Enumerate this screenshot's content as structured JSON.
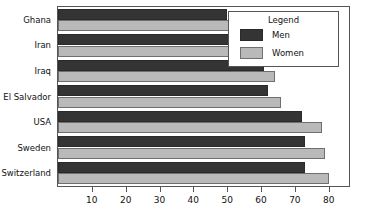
{
  "chart_data": {
    "type": "bar",
    "orientation": "horizontal",
    "title": "",
    "xlabel": "",
    "ylabel": "",
    "categories": [
      "Ghana",
      "Iran",
      "Iraq",
      "El Salvador",
      "USA",
      "Sweden",
      "Switzerland"
    ],
    "series": [
      {
        "name": "Men",
        "color": "#343434",
        "values": [
          50,
          57,
          61,
          62,
          72,
          73,
          73
        ]
      },
      {
        "name": "Women",
        "color": "#b9b9b9",
        "values": [
          54,
          57,
          64,
          66,
          78,
          79,
          80
        ]
      }
    ],
    "xlim": [
      0,
      86
    ],
    "xticks": [
      10,
      20,
      30,
      40,
      50,
      60,
      70,
      80
    ],
    "xticklabels": [
      "10",
      "20",
      "30",
      "40",
      "50",
      "60",
      "70",
      "80"
    ],
    "grid": false,
    "legend": {
      "title": "Legend",
      "position": "top-right",
      "entries": [
        {
          "label": "Men",
          "swatch": "men"
        },
        {
          "label": "Women",
          "swatch": "women"
        }
      ]
    }
  }
}
